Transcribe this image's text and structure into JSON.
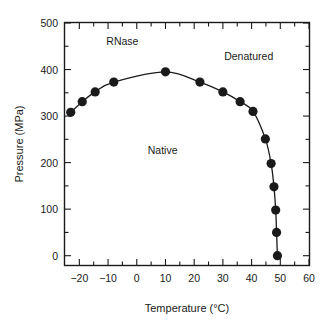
{
  "chart_data": {
    "type": "line",
    "title": "",
    "xlabel": "Temperature (°C)",
    "ylabel": "Pressure (MPa)",
    "xlim": [
      -25,
      60
    ],
    "ylim": [
      -20,
      500
    ],
    "xticks": [
      -20,
      -10,
      0,
      10,
      20,
      30,
      40,
      50,
      60
    ],
    "xtick_labels": [
      "−20",
      "−10",
      "0",
      "10",
      "20",
      "30",
      "40",
      "50",
      "60"
    ],
    "yticks": [
      0,
      100,
      200,
      300,
      400,
      500
    ],
    "ytick_labels": [
      "0",
      "100",
      "200",
      "300",
      "400",
      "500"
    ],
    "xminor_step": 5,
    "yminor_step": 50,
    "grid": false,
    "legend": null,
    "series": [
      {
        "name": "Native–Denatured phase boundary",
        "marker": "filled-circle",
        "color": "#1a1a1a",
        "x": [
          -23.0,
          -19.0,
          -14.5,
          -8.0,
          10.0,
          22.0,
          30.0,
          36.0,
          40.5,
          44.8,
          46.8,
          47.8,
          48.4,
          48.7,
          49.0
        ],
        "y": [
          308,
          331,
          352,
          373,
          395,
          373,
          352,
          331,
          310,
          251,
          198,
          148,
          98,
          50,
          0
        ]
      }
    ],
    "annotations": [
      {
        "text": "RNase",
        "x": -5.0,
        "y": 452
      },
      {
        "text": "Denatured",
        "x": 39.0,
        "y": 420
      },
      {
        "text": "Native",
        "x": 9.0,
        "y": 218
      }
    ]
  }
}
